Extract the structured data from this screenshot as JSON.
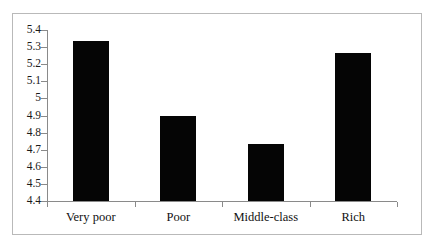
{
  "figure": {
    "cut_off_caption_top": "",
    "frame_border_color": "#b9b9b9",
    "background_color": "#ffffff",
    "bar_color": "#050505",
    "axis_color": "#8a8a8a",
    "text_color": "#111111"
  },
  "chart_data": {
    "type": "bar",
    "title": "",
    "xlabel": "",
    "ylabel": "",
    "categories": [
      "Very poor",
      "Poor",
      "Middle-class",
      "Rich"
    ],
    "values": [
      5.335,
      4.895,
      4.735,
      5.265
    ],
    "ylim": [
      4.4,
      5.4
    ],
    "ytick_values": [
      5.4,
      5.3,
      5.2,
      5.1,
      5.0,
      4.9,
      4.8,
      4.7,
      4.6,
      4.5,
      4.4
    ],
    "ytick_labels": [
      "5.4",
      "5.3",
      "5.2",
      "5.1",
      "5",
      "4.9",
      "4.8",
      "4.7",
      "4.6",
      "4.5",
      "4.4"
    ],
    "grid": false,
    "legend": null,
    "legend_position": "none",
    "series": [
      {
        "name": "",
        "values": [
          5.335,
          4.895,
          4.735,
          5.265
        ]
      }
    ]
  }
}
